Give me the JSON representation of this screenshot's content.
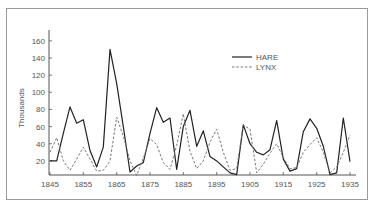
{
  "chart_data": {
    "type": "line",
    "title": "",
    "xlabel": "",
    "ylabel": "Thousands",
    "xlim": [
      1845,
      1935
    ],
    "ylim": [
      0,
      170
    ],
    "grid": false,
    "legend_position": "upper-right-inside",
    "x_ticks": [
      1845,
      1855,
      1865,
      1875,
      1885,
      1895,
      1905,
      1915,
      1925,
      1935
    ],
    "y_ticks": [
      20,
      40,
      60,
      80,
      100,
      120,
      140,
      160
    ],
    "x": [
      1845,
      1847,
      1849,
      1851,
      1853,
      1855,
      1857,
      1859,
      1861,
      1863,
      1865,
      1867,
      1869,
      1871,
      1873,
      1875,
      1877,
      1879,
      1881,
      1883,
      1885,
      1887,
      1889,
      1891,
      1893,
      1895,
      1897,
      1899,
      1901,
      1903,
      1905,
      1907,
      1909,
      1911,
      1913,
      1915,
      1917,
      1919,
      1921,
      1923,
      1925,
      1927,
      1929,
      1931,
      1933,
      1935
    ],
    "series": [
      {
        "name": "HARE",
        "style": "solid",
        "values": [
          20,
          20,
          52,
          83,
          64,
          68,
          32,
          13,
          36,
          150,
          110,
          60,
          7,
          14,
          18,
          52,
          82,
          65,
          70,
          10,
          60,
          79,
          37,
          55,
          25,
          20,
          13,
          6,
          4,
          62,
          40,
          30,
          27,
          33,
          67,
          22,
          8,
          11,
          54,
          69,
          58,
          37,
          4,
          6,
          70,
          19
        ]
      },
      {
        "name": "LYNX",
        "style": "dashed",
        "values": [
          30,
          47,
          20,
          9,
          22,
          36,
          22,
          8,
          9,
          20,
          71,
          49,
          20,
          3,
          23,
          46,
          39,
          18,
          10,
          38,
          75,
          31,
          11,
          20,
          42,
          57,
          30,
          9,
          11,
          62,
          57,
          6,
          16,
          29,
          40,
          24,
          11,
          12,
          30,
          39,
          47,
          30,
          6,
          13,
          30,
          50
        ]
      }
    ]
  },
  "legend": {
    "items": [
      {
        "label": "HARE",
        "style": "solid"
      },
      {
        "label": "LYNX",
        "style": "dashed"
      }
    ]
  },
  "axes": {
    "ylabel": "Thousands",
    "x_tick_labels": [
      "1845",
      "1855",
      "1865",
      "1875",
      "1885",
      "1895",
      "1905",
      "1915",
      "1925",
      "1935"
    ],
    "y_tick_labels": [
      "20",
      "40",
      "60",
      "80",
      "100",
      "120",
      "140",
      "160"
    ]
  },
  "colors": {
    "hare_line": "#222222",
    "lynx_line": "#777777",
    "axis": "#555555",
    "frame": "#9a9a9a"
  }
}
